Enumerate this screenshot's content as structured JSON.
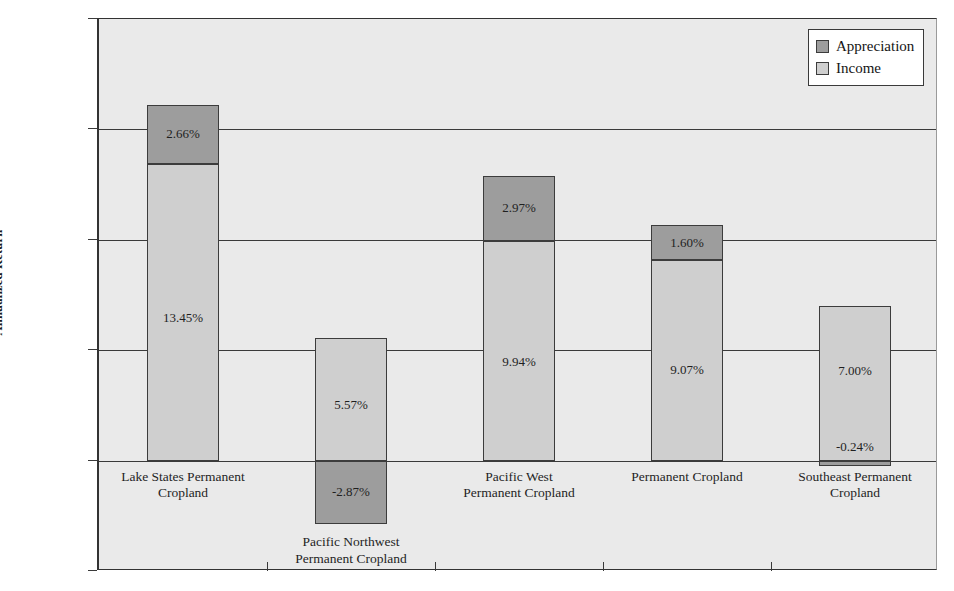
{
  "chart_data": {
    "type": "bar",
    "subtype": "stacked-bar",
    "title": "",
    "xlabel": "",
    "ylabel": "Annualized Return",
    "ylim": [
      -5.0,
      20.0
    ],
    "ytick_step": 5.0,
    "ytick_labels": [
      "20.00%",
      "15.00%",
      "10.00%",
      "5.00%",
      "0.00%",
      "-5.00%"
    ],
    "ytick_values": [
      20.0,
      15.0,
      10.0,
      5.0,
      0.0,
      -5.0
    ],
    "grid": true,
    "legend_position": "top-right",
    "categories": [
      "Lake States Permanent Cropland",
      "Pacific Northwest Permanent Cropland",
      "Pacific West Permanent Cropland",
      "Permanent Cropland",
      "Southeast Permanent Cropland"
    ],
    "category_lines": [
      [
        "Lake States Permanent",
        "Cropland"
      ],
      [
        "Pacific Northwest",
        "Permanent Cropland"
      ],
      [
        "Pacific West",
        "Permanent Cropland"
      ],
      [
        "Permanent Cropland",
        ""
      ],
      [
        "Southeast Permanent",
        "Cropland"
      ]
    ],
    "series": [
      {
        "name": "Income",
        "color": "#cfcfcf",
        "values": [
          13.45,
          5.57,
          9.94,
          9.07,
          7.0
        ],
        "labels": [
          "13.45%",
          "5.57%",
          "9.94%",
          "9.07%",
          "7.00%"
        ]
      },
      {
        "name": "Appreciation",
        "color": "#9d9d9d",
        "values": [
          2.66,
          -2.87,
          2.97,
          1.6,
          -0.24
        ],
        "labels": [
          "2.66%",
          "-2.87%",
          "2.97%",
          "1.60%",
          "-0.24%"
        ]
      }
    ],
    "totals": [
      16.11,
      2.7,
      12.91,
      10.67,
      6.76
    ]
  },
  "legend": {
    "items": [
      {
        "label": "Appreciation",
        "color": "#9d9d9d"
      },
      {
        "label": "Income",
        "color": "#cfcfcf"
      }
    ]
  },
  "axis": {
    "y_title": "Annualized Return"
  }
}
